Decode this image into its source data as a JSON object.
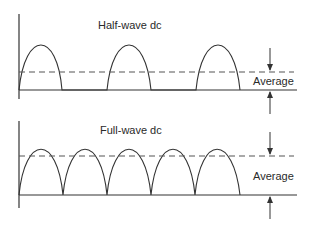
{
  "diagram": {
    "panels": [
      {
        "id": "half-wave",
        "title": "Half-wave dc",
        "average_label": "Average",
        "waveform": "half-wave rectified",
        "pulses": 3
      },
      {
        "id": "full-wave",
        "title": "Full-wave dc",
        "average_label": "Average",
        "waveform": "full-wave rectified",
        "pulses": 5
      }
    ],
    "colors": {
      "line": "#333333",
      "dashed": "#555555",
      "background": "#ffffff"
    }
  }
}
